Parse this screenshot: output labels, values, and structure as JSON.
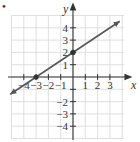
{
  "chart_data": {
    "type": "line",
    "title": "",
    "xlabel": "x",
    "ylabel": "y",
    "xlim": [
      -5,
      4
    ],
    "ylim": [
      -5,
      5
    ],
    "grid": true,
    "x_ticks": [
      -4,
      -3,
      -2,
      -1,
      1,
      2,
      3
    ],
    "y_ticks": [
      -4,
      -3,
      -2,
      -1,
      1,
      2,
      3,
      4
    ],
    "x_tick_labels": [
      "−4",
      "−3",
      "−2",
      "−1",
      "1",
      "2",
      "3"
    ],
    "y_tick_labels": [
      "−4",
      "−3",
      "−2",
      "1",
      "2",
      "3",
      "4"
    ],
    "series": [
      {
        "name": "line",
        "description": "Line through (-3, 0) and (0, 2), slope 2/3, arrows at both ends",
        "slope": 0.6667,
        "intercept": 2,
        "points": [
          {
            "x": -3,
            "y": 0
          },
          {
            "x": 0,
            "y": 2
          }
        ],
        "color": "#555555"
      }
    ],
    "marked_points": [
      {
        "x": -3,
        "y": 0,
        "label": ""
      },
      {
        "x": 0,
        "y": 2,
        "label": ""
      }
    ]
  },
  "bullet": "•"
}
